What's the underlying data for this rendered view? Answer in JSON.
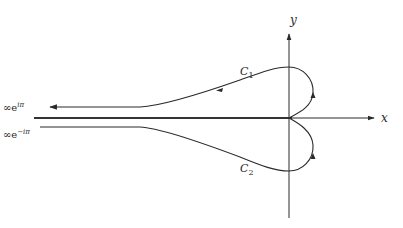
{
  "diagram": {
    "type": "contour-integral-complex-plane",
    "axes": {
      "x_label": "x",
      "y_label": "y"
    },
    "contours": [
      {
        "name": "C1",
        "label_main": "C",
        "label_sub": "1",
        "description": "upper contour from origin, looping counterclockwise above x-axis, going out to infinity along upper side of negative real axis"
      },
      {
        "name": "C2",
        "label_main": "C",
        "label_sub": "2",
        "description": "lower contour from infinity along lower side of negative real axis, looping below x-axis back to origin"
      }
    ],
    "endpoints": {
      "upper": {
        "base": "∞e",
        "exponent": "iπ"
      },
      "lower": {
        "base": "∞e",
        "exponent": "−iπ"
      }
    },
    "colors": {
      "stroke": "#2a2a2a",
      "branch_cut": "#333333",
      "background": "#ffffff"
    }
  }
}
